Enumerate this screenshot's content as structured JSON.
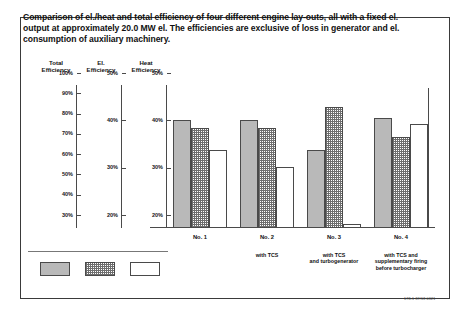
{
  "caption": "Comparison of el./heat and total efficiency of four different engine lay-outs, all with a fixed el. output at approximately 20.0 MW el. The efficiencies are exclusive of loss in generator and el. consumption of auxiliary machinery.",
  "axis_headers": [
    {
      "line1": "Total",
      "line2": "Efficiency"
    },
    {
      "line1": "El.",
      "line2": "Efficiency"
    },
    {
      "line1": "Heat",
      "line2": "Efficiency"
    }
  ],
  "doc_reference": "178-1 87/18 0321",
  "chart_data": {
    "type": "bar",
    "title": "Comparison of el./heat and total efficiency of four different engine lay-outs, all with a fixed el. output at approximately 20.0 MW el. The efficiencies are exclusive of loss in generator and el. consumption of auxiliary machinery.",
    "xlabel": "",
    "ylabel": "Efficiency",
    "grid": false,
    "legend_position": "bottom-left",
    "categories": [
      "No. 1",
      "No. 2",
      "No. 3",
      "No. 4"
    ],
    "category_subtitles": [
      "",
      "with TCS",
      "with TCS\nand turbogenerator",
      "with TCS and\nsupplementary firing\nbefore turbocharger"
    ],
    "axes": [
      {
        "name": "Total Efficiency",
        "ticks": [
          "100%",
          "90%",
          "80%",
          "70%",
          "60%",
          "50%",
          "40%",
          "30%"
        ],
        "values": [
          100,
          90,
          80,
          70,
          60,
          50,
          40,
          30
        ],
        "ylim": [
          30,
          100
        ]
      },
      {
        "name": "El. Efficiency",
        "ticks": [
          "50%",
          "40%",
          "30%",
          "20%"
        ],
        "values": [
          50,
          40,
          30,
          20
        ],
        "ylim": [
          20,
          50
        ]
      },
      {
        "name": "Heat Efficiency",
        "ticks": [
          "50%",
          "40%",
          "30%",
          "20%"
        ],
        "values": [
          50,
          40,
          30,
          20
        ],
        "ylim": [
          20,
          50
        ]
      }
    ],
    "series": [
      {
        "name": "Total Efficiency",
        "axis": 0,
        "style": "solid-gray",
        "values": [
          88,
          88,
          72,
          89
        ]
      },
      {
        "name": "El. Efficiency",
        "axis": 1,
        "style": "dotted",
        "values": [
          43,
          43,
          48,
          41
        ]
      },
      {
        "name": "Heat Efficiency",
        "axis": 2,
        "style": "white",
        "values": [
          38,
          34,
          21,
          44
        ]
      }
    ]
  },
  "legend": [
    {
      "label": "Total Efficiency",
      "style": "solid-gray"
    },
    {
      "label": "El. Efficiency",
      "style": "dotted"
    },
    {
      "label": "Heat Efficiency",
      "style": "white"
    }
  ]
}
